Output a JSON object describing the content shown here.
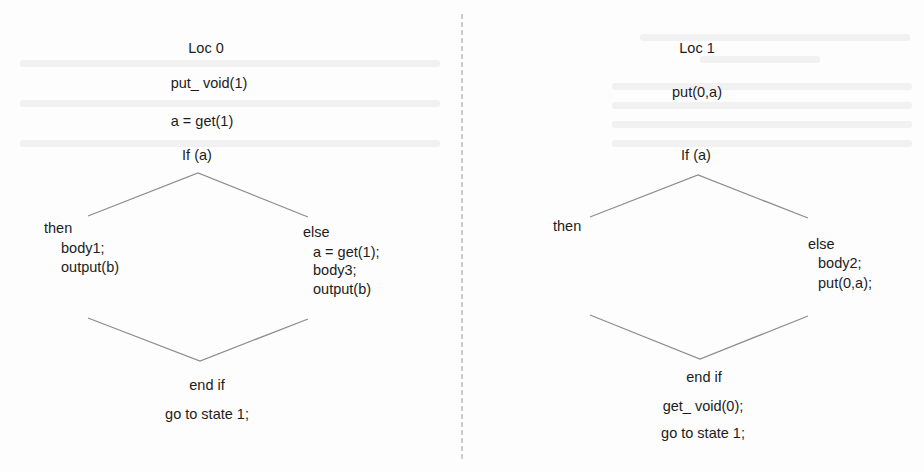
{
  "diagram": {
    "type": "control-flow state diagrams",
    "divider": {
      "style": "dashed",
      "color": "#9a9a9a"
    },
    "line_color": "#8c8c8c",
    "text_color": "#1c1c1c",
    "left": {
      "title": "Loc 0",
      "pre": [
        "put_ void(1)",
        "a = get(1)"
      ],
      "condition": "If (a)",
      "then": {
        "label": "then",
        "body": [
          "body1;",
          "output(b)"
        ]
      },
      "else": {
        "label": "else",
        "body": [
          "a = get(1);",
          "body3;",
          "output(b)"
        ]
      },
      "end": "end if",
      "post": [
        "go to state 1;"
      ]
    },
    "right": {
      "title": "Loc 1",
      "pre": [
        "put(0,a)"
      ],
      "condition": "If (a)",
      "then": {
        "label": "then",
        "body": []
      },
      "else": {
        "label": "else",
        "body": [
          "body2;",
          "put(0,a);"
        ]
      },
      "end": "end if",
      "post": [
        "get_ void(0);",
        "go to state 1;"
      ]
    }
  }
}
